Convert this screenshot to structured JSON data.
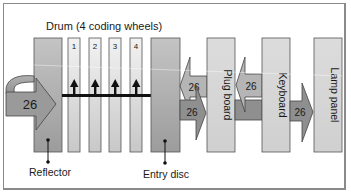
{
  "diagram": {
    "title": "Drum (4 coding wheels)",
    "components": {
      "reflector": {
        "label": "Reflector"
      },
      "wheels": [
        {
          "label": "1"
        },
        {
          "label": "2"
        },
        {
          "label": "3"
        },
        {
          "label": "4"
        }
      ],
      "entry_disc": {
        "label": "Entry disc"
      },
      "plug_board": {
        "label": "Plug board"
      },
      "keyboard": {
        "label": "Keyboard"
      },
      "lamp_panel": {
        "label": "Lamp panel"
      }
    },
    "connections": {
      "reflector_loop": "26",
      "entry_from_plug": "26",
      "entry_to_plug": "26",
      "plug_from_keyboard": "26",
      "keyboard_to_lamp": "26"
    },
    "colors": {
      "dark_block": "#a9a9a9",
      "light_block": "#d9d9d9",
      "arrow_dark": "#8f8f8f",
      "arrow_light": "#b8b8b8",
      "outline": "#555555"
    }
  }
}
